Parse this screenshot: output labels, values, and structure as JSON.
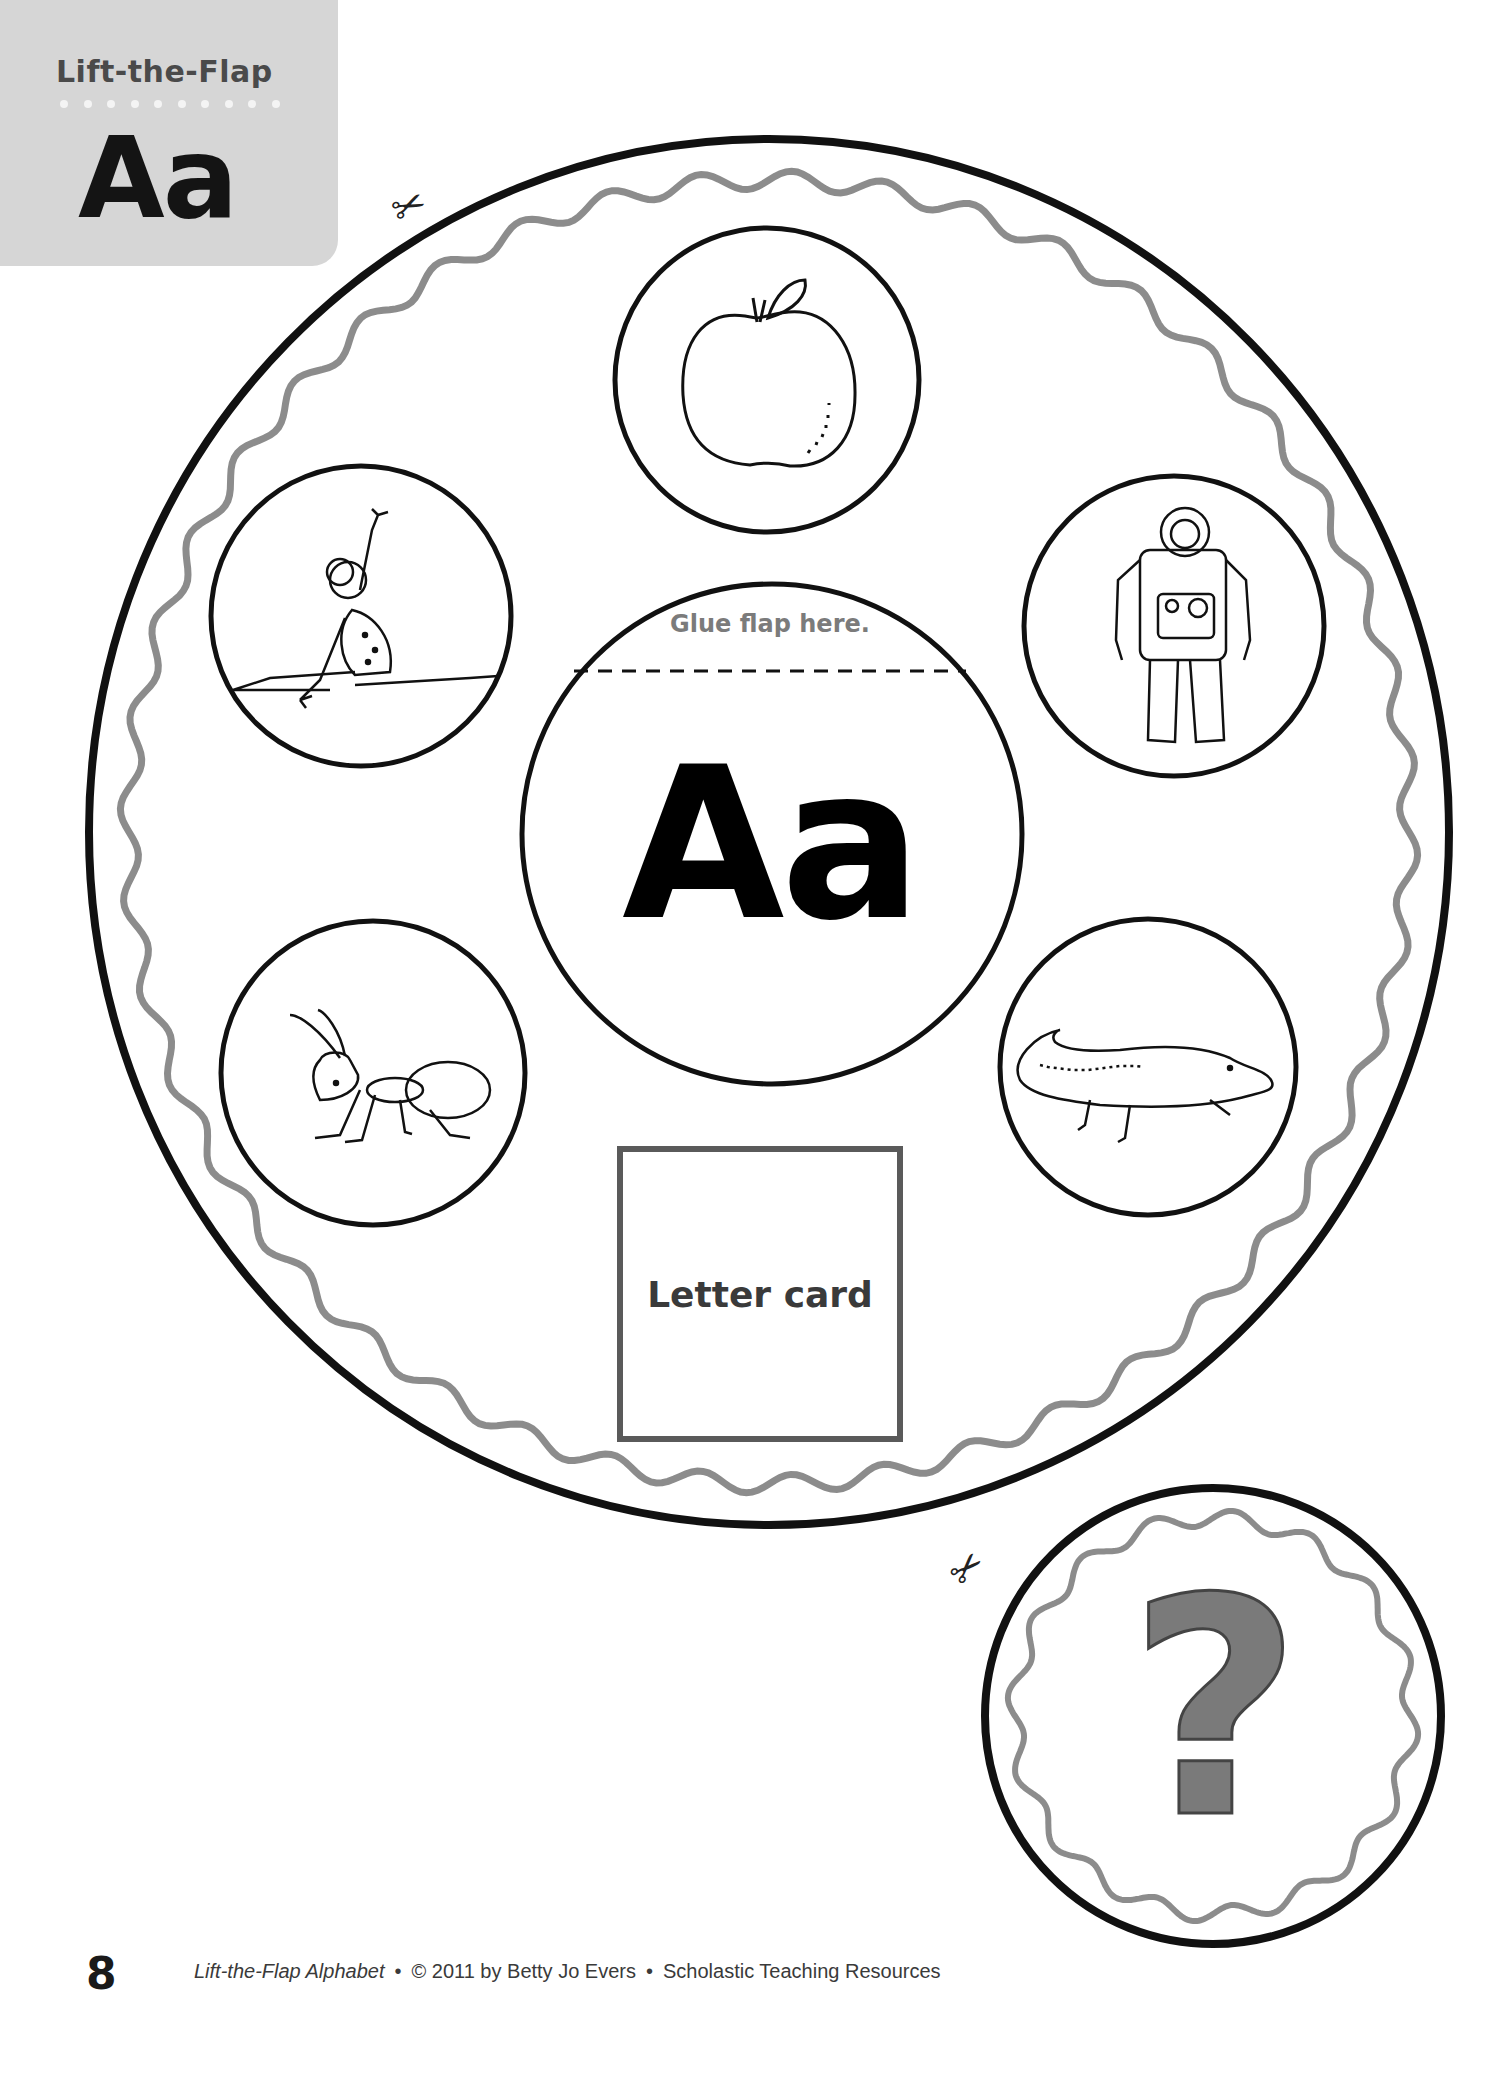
{
  "header": {
    "kicker": "Lift-the-Flap",
    "letter": "Aa",
    "dot_count": 10,
    "tab_color": "#d6d6d6"
  },
  "wheel": {
    "flap_instruction": "Glue flap here.",
    "center_letter": "Aa",
    "letter_card_label": "Letter card",
    "pictures": [
      {
        "position": "top",
        "subject": "apple"
      },
      {
        "position": "upper-left",
        "subject": "acrobat"
      },
      {
        "position": "upper-right",
        "subject": "astronaut"
      },
      {
        "position": "lower-left",
        "subject": "ant"
      },
      {
        "position": "lower-right",
        "subject": "alligator"
      }
    ],
    "outline_color": "#111111",
    "wavy_border_color": "#8c8c8c"
  },
  "flap": {
    "symbol": "?",
    "symbol_color": "#7a7a7a"
  },
  "cut_marks": [
    {
      "icon": "scissors-icon",
      "location": "wheel-top-left"
    },
    {
      "icon": "scissors-icon",
      "location": "flap-top-left"
    }
  ],
  "footer": {
    "page_number": "8",
    "book_title": "Lift-the-Flap Alphabet",
    "copyright": "© 2011 by Betty Jo Evers",
    "publisher": "Scholastic Teaching Resources",
    "separator": "•"
  }
}
